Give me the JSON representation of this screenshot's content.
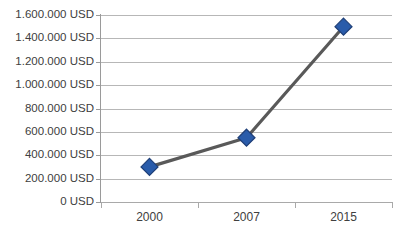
{
  "chart_title": "",
  "axis": {
    "y_unit": "USD",
    "y_tick_labels": [
      "1.600.000 USD",
      "1.400.000 USD",
      "1.200.000 USD",
      "1.000.000 USD",
      "800.000 USD",
      "600.000 USD",
      "400.000 USD",
      "200.000 USD",
      "0 USD"
    ],
    "x_tick_labels": [
      "2000",
      "2007",
      "2015"
    ]
  },
  "colors": {
    "marker": "#2a5caa",
    "marker_edge": "#1f3f77",
    "line": "#595959",
    "gridline": "#b7b7b7",
    "axis": "#9a9a9a",
    "text": "#404040",
    "background": "#ffffff"
  },
  "chart_data": {
    "type": "line",
    "title": "",
    "xlabel": "",
    "ylabel": "",
    "categories": [
      "2000",
      "2007",
      "2015"
    ],
    "values": [
      300000,
      550000,
      1500000
    ],
    "value_labels": [
      "300.000 USD",
      "550.000 USD",
      "1.500.000 USD"
    ],
    "series": [
      {
        "name": "USD",
        "values": [
          300000,
          550000,
          1500000
        ]
      }
    ],
    "ylim": [
      0,
      1600000
    ],
    "ytick_values": [
      1600000,
      1400000,
      1200000,
      1000000,
      800000,
      600000,
      400000,
      200000,
      0
    ],
    "grid": true,
    "legend": "none",
    "marker_shape": "diamond"
  }
}
